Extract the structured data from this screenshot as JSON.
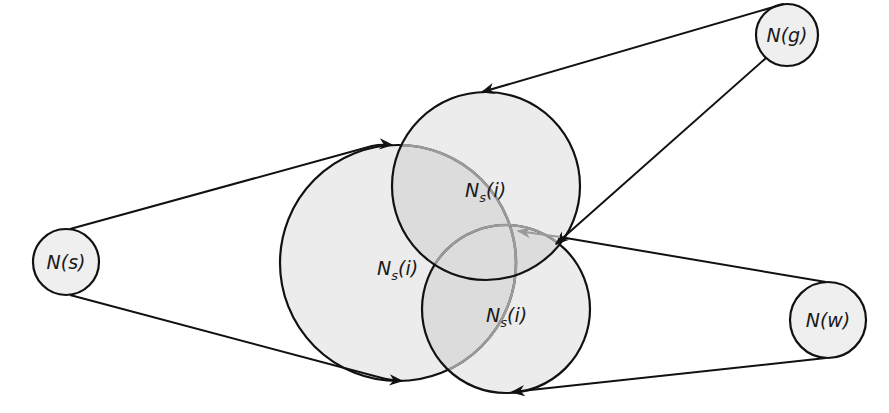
{
  "diagram": {
    "type": "set-neighborhood diagram",
    "colors": {
      "fill": "#ececec",
      "overlap": "#d9d9d9",
      "stroke": "#111111",
      "hidden_stroke": "#9a9a9a",
      "background": "#ffffff"
    },
    "nodes": [
      {
        "id": "s",
        "label": "N(s)",
        "cx": 66,
        "cy": 262,
        "r": 33
      },
      {
        "id": "g",
        "label": "N(g)",
        "cx": 787,
        "cy": 35,
        "r": 31
      },
      {
        "id": "w",
        "label": "N(w)",
        "cx": 828,
        "cy": 320,
        "r": 38
      }
    ],
    "neighborhoods": [
      {
        "id": "left",
        "label_main": "N",
        "label_sub": "s",
        "label_tail": "(i)",
        "cx": 398,
        "cy": 263,
        "r": 118
      },
      {
        "id": "top",
        "label_main": "N",
        "label_sub": "s",
        "label_tail": "(i)",
        "cx": 486,
        "cy": 186,
        "r": 94
      },
      {
        "id": "bottom",
        "label_main": "N",
        "label_sub": "s",
        "label_tail": "(i)",
        "cx": 506,
        "cy": 309,
        "r": 84
      }
    ],
    "edges": [
      {
        "from": "N(s)",
        "to": "left neighborhood (top tangent)"
      },
      {
        "from": "N(s)",
        "to": "left neighborhood (bottom tangent)"
      },
      {
        "from": "N(g)",
        "to": "top neighborhood (top tangent)"
      },
      {
        "from": "N(g)",
        "to": "top/bottom intersection"
      },
      {
        "from": "N(w)",
        "to": "bottom neighborhood (top tangent)"
      },
      {
        "from": "N(w)",
        "to": "bottom neighborhood (bottom tangent)"
      }
    ]
  }
}
